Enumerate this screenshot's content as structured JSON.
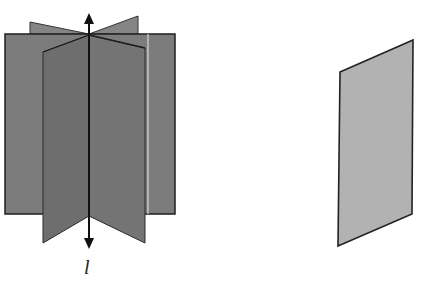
{
  "figure": {
    "left": {
      "description": "planes intersecting along a common line",
      "axis_label": "l",
      "colors": {
        "back_plane": "#7c7c7c",
        "back_wings": "#858585",
        "front_left": "#6e6e6e",
        "front_right": "#747474",
        "outline": "#1e1e1e",
        "highlight": "#d8d8d8"
      }
    },
    "right": {
      "description": "single plane (parallelogram)",
      "colors": {
        "fill": "#b2b2b2",
        "outline": "#222222"
      }
    }
  }
}
